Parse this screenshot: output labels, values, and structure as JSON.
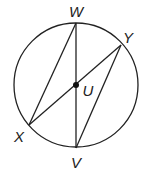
{
  "diagram": {
    "type": "circle-geometry",
    "center": {
      "label": "U",
      "x": 76,
      "y": 85
    },
    "radius": 62,
    "points": [
      {
        "label": "W",
        "x": 76,
        "y": 23,
        "lx": 76,
        "ly": 17
      },
      {
        "label": "Y",
        "x": 121,
        "y": 45,
        "lx": 128,
        "ly": 43
      },
      {
        "label": "X",
        "x": 29,
        "y": 125,
        "lx": 19,
        "ly": 142
      },
      {
        "label": "V",
        "x": 76,
        "y": 148,
        "lx": 76,
        "ly": 168
      }
    ],
    "center_label_pos": {
      "x": 88,
      "y": 96
    },
    "segments": [
      [
        "W",
        "V"
      ],
      [
        "X",
        "Y"
      ],
      [
        "W",
        "X"
      ],
      [
        "Y",
        "V"
      ]
    ],
    "colors": {
      "stroke": "#222222",
      "background": "#ffffff"
    }
  }
}
